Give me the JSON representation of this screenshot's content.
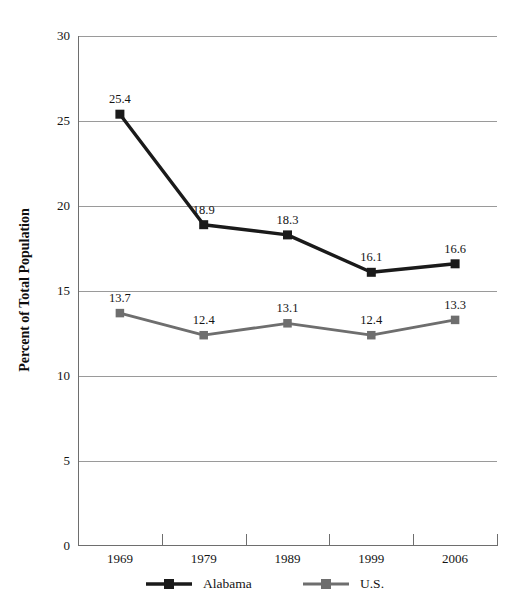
{
  "chart_data": {
    "type": "line",
    "title": "",
    "xlabel": "",
    "ylabel": "Percent of Total Population",
    "categories": [
      "1969",
      "1979",
      "1989",
      "1999",
      "2006"
    ],
    "ylim": [
      0,
      30
    ],
    "yticks": [
      0,
      5,
      10,
      15,
      20,
      25,
      30
    ],
    "ytick_labels": [
      "0",
      "5",
      "10",
      "15",
      "20",
      "25",
      "30"
    ],
    "grid": "horizontal",
    "legend_position": "bottom",
    "series": [
      {
        "name": "Alabama",
        "color": "#1a1a1a",
        "marker": "square",
        "values": [
          25.4,
          18.9,
          18.3,
          16.1,
          16.6
        ],
        "data_labels": [
          "25.4",
          "18.9",
          "18.3",
          "16.1",
          "16.6"
        ]
      },
      {
        "name": "U.S.",
        "color": "#6e6e6e",
        "marker": "square",
        "values": [
          13.7,
          12.4,
          13.1,
          12.4,
          13.3
        ],
        "data_labels": [
          "13.7",
          "12.4",
          "13.1",
          "12.4",
          "13.3"
        ]
      }
    ]
  },
  "legend": {
    "entries": [
      {
        "label": "Alabama",
        "color": "#1a1a1a"
      },
      {
        "label": "U.S.",
        "color": "#6e6e6e"
      }
    ]
  },
  "axes": {
    "y_title": "Percent of Total Population"
  },
  "colors": {
    "series_alabama": "#1a1a1a",
    "series_us": "#6e6e6e",
    "gridline": "#9a9a9a",
    "axis": "#6e6e6e",
    "background": "#ffffff",
    "text": "#141414"
  }
}
